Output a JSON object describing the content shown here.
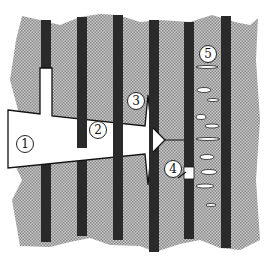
{
  "figure": {
    "colors": {
      "matrix": "#b8b8b8",
      "fiber": "#2a2a2a",
      "crack": "#ffffff",
      "outline": "#111111"
    },
    "fibers_x": [
      41,
      77,
      113,
      149,
      184,
      221
    ],
    "labels": [
      {
        "id": "1",
        "text": "1",
        "meaning": "crack"
      },
      {
        "id": "2",
        "text": "2",
        "meaning": "fiber bridging"
      },
      {
        "id": "3",
        "text": "3",
        "meaning": "fiber/matrix debonding"
      },
      {
        "id": "4",
        "text": "4",
        "meaning": "fiber fracture"
      },
      {
        "id": "5",
        "text": "5",
        "meaning": "matrix microcracking"
      }
    ]
  }
}
